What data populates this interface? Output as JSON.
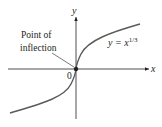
{
  "figure": {
    "x_axis_label": "x",
    "y_axis_label": "y",
    "origin_label": "0",
    "annotation_line1": "Point of",
    "annotation_line2": "inflection",
    "equation_prefix": "y = x",
    "equation_exponent": "1/3",
    "colors": {
      "curve": "#5a5a5a",
      "axes": "#231f20",
      "point": "#231f20"
    }
  }
}
